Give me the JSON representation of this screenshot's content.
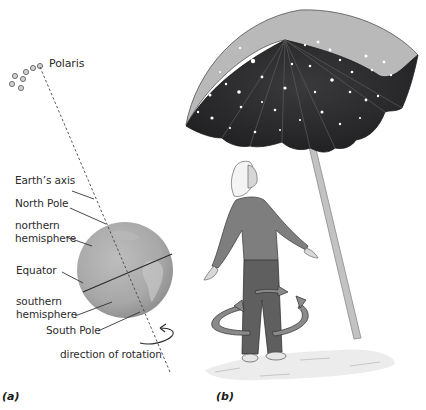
{
  "figure": {
    "panel_a": {
      "label": "(a)",
      "star_label": "Polaris",
      "labels": {
        "earths_axis": "Earth’s axis",
        "north_pole": "North Pole",
        "northern_hemisphere_1": "northern",
        "northern_hemisphere_2": "hemisphere",
        "equator": "Equator",
        "southern_hemisphere_1": "southern",
        "southern_hemisphere_2": "hemisphere",
        "south_pole": "South Pole",
        "direction_of_rotation": "direction of rotation"
      }
    },
    "panel_b": {
      "label": "(b)"
    },
    "colors": {
      "globe": "#a9a9a9",
      "umbrella_inner": "#2e2e30",
      "umbrella_outer": "#b8b8b8",
      "pole": "#bdbdbd",
      "sweater": "#7d7d7d",
      "pants": "#5e5e5e",
      "line": "#333333"
    }
  }
}
